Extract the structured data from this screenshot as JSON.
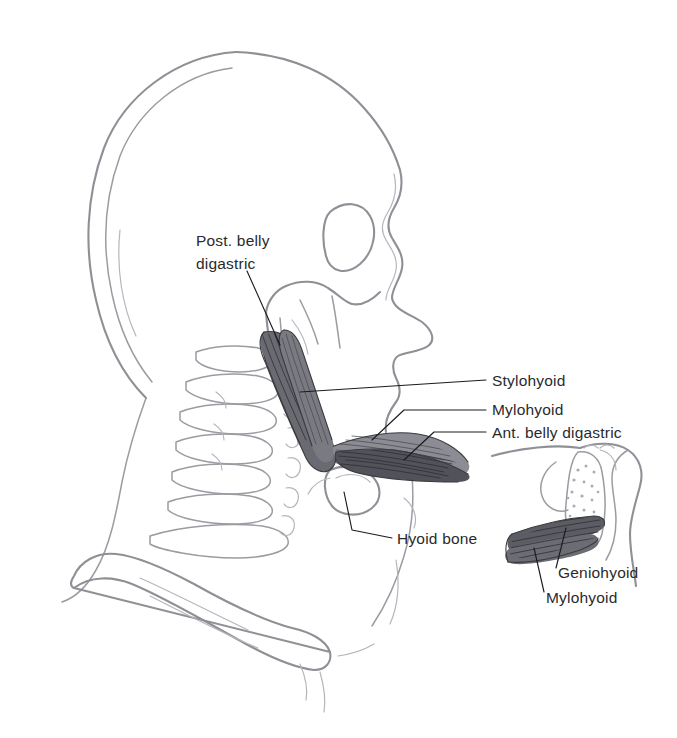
{
  "figure": {
    "background_color": "#ffffff",
    "line_color": "#8e9096",
    "muscle_color": "#4a4a50",
    "text_color": "#2a2a2c",
    "leader_color": "#1c1c1e"
  },
  "labels": {
    "post_belly_digastric_line1": "Post. belly",
    "post_belly_digastric_line2": "digastric",
    "stylohyoid": "Stylohyoid",
    "mylohyoid": "Mylohyoid",
    "ant_belly_digastric": "Ant. belly digastric",
    "hyoid_bone": "Hyoid bone",
    "inset_geniohyoid": "Geniohyoid",
    "inset_mylohyoid": "Mylohyoid"
  },
  "structures": {
    "main_view": [
      "cranium",
      "facial-profile",
      "mandible",
      "cervical-vertebrae",
      "clavicle",
      "hyoid-bone",
      "posterior-belly-digastric",
      "stylohyoid-muscle",
      "mylohyoid-muscle",
      "anterior-belly-digastric"
    ],
    "inset_view": [
      "mandible-section",
      "tongue-section",
      "geniohyoid-muscle",
      "mylohyoid-muscle"
    ]
  }
}
